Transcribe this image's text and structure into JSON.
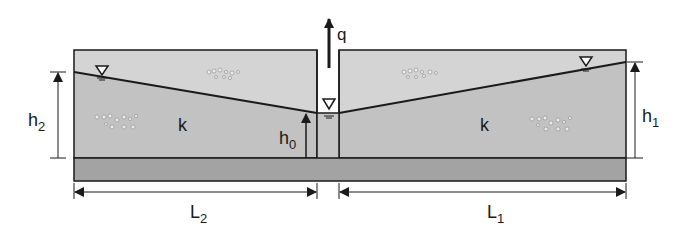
{
  "diagram": {
    "title": "",
    "labels": {
      "flow": "q",
      "conductivity_left": "k",
      "conductivity_right": "k",
      "head_left": "h",
      "head_left_sub": "2",
      "head_right": "h",
      "head_right_sub": "1",
      "head_well": "h",
      "head_well_sub": "0",
      "length_left": "L",
      "length_left_sub": "2",
      "length_right": "L",
      "length_right_sub": "1"
    },
    "colors": {
      "unsaturated": "#d4d4d4",
      "saturated": "#c2c2c2",
      "base_layer": "#a3a3a3",
      "well_water": "#c6c6c6",
      "line": "#1a1a1a",
      "background": "#ffffff"
    },
    "icons": [
      "water-table-triangle-left",
      "water-table-triangle-well",
      "water-table-triangle-right"
    ]
  }
}
